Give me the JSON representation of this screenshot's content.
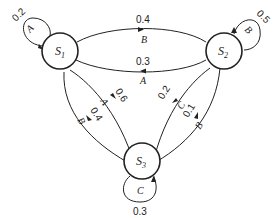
{
  "diagram": {
    "type": "state-transition",
    "states": [
      {
        "id": "S1",
        "name": "S",
        "sub": "1"
      },
      {
        "id": "S2",
        "name": "S",
        "sub": "2"
      },
      {
        "id": "S3",
        "name": "S",
        "sub": "3"
      }
    ],
    "transitions": [
      {
        "from": "S1",
        "to": "S1",
        "symbol": "A",
        "prob": "0.2"
      },
      {
        "from": "S1",
        "to": "S2",
        "symbol": "B",
        "prob": "0.4"
      },
      {
        "from": "S2",
        "to": "S1",
        "symbol": "A",
        "prob": "0.3"
      },
      {
        "from": "S2",
        "to": "S2",
        "symbol": "B",
        "prob": "0.5"
      },
      {
        "from": "S1",
        "to": "S3",
        "symbol": "A",
        "prob": "0.6"
      },
      {
        "from": "S3",
        "to": "S1",
        "symbol": "B",
        "prob": "0.4"
      },
      {
        "from": "S2",
        "to": "S3",
        "symbol": "C",
        "prob": "0.2"
      },
      {
        "from": "S3",
        "to": "S2",
        "symbol": "B",
        "prob": "0.1"
      },
      {
        "from": "S3",
        "to": "S3",
        "symbol": "C",
        "prob": "0.3"
      }
    ],
    "colors": {
      "stroke": "#222222",
      "background": "#ffffff"
    }
  }
}
